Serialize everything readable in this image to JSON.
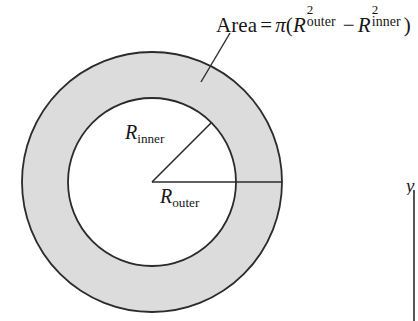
{
  "figure": {
    "background_color": "#ffffff",
    "stroke_color": "#2b2b2b",
    "annulus_fill_color": "#dcdcdc",
    "formula": {
      "area_word": "Area",
      "equals": "=",
      "pi": "π",
      "open_paren": "(",
      "r_symbol": "R",
      "outer_subscript": "outer",
      "inner_subscript": "inner",
      "exponent": "2",
      "minus": "−",
      "close_paren": ")",
      "plain_text": "Area = π(R²outer − R²inner)"
    },
    "labels": {
      "r_inner_symbol": "R",
      "r_inner_subscript": "inner",
      "r_outer_symbol": "R",
      "r_outer_subscript": "outer"
    },
    "axis": {
      "y_label": "y"
    },
    "geometry": {
      "center_x": 152,
      "center_y": 182,
      "outer_radius": 130,
      "inner_radius": 84,
      "outer_radius_line_end_x": 282,
      "inner_radius_line_angle_deg": 45,
      "leader_line_start_x": 230,
      "leader_line_start_y": 33,
      "leader_line_end_x": 201,
      "leader_line_end_y": 82
    }
  }
}
